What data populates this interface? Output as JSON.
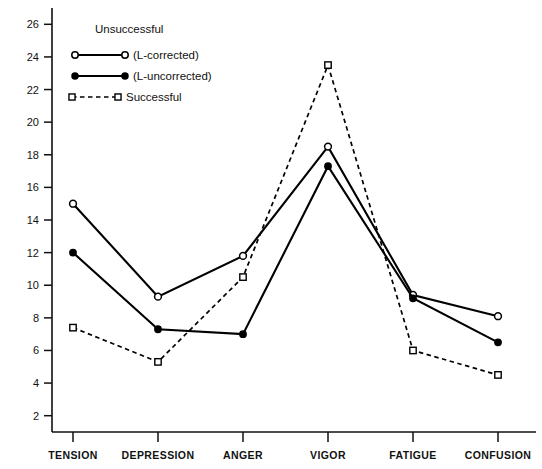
{
  "chart_data": {
    "type": "line",
    "title": "",
    "xlabel": "",
    "ylabel": "",
    "categories": [
      "TENSION",
      "DEPRESSION",
      "ANGER",
      "VIGOR",
      "FATIGUE",
      "CONFUSION"
    ],
    "ylim": [
      1,
      27
    ],
    "yticks": [
      2,
      4,
      6,
      8,
      10,
      12,
      14,
      16,
      18,
      20,
      22,
      24,
      26
    ],
    "grid": false,
    "legend_position": "top-left",
    "series": [
      {
        "name": "Unsuccessful (L-corrected)",
        "marker": "open-circle",
        "line": "solid",
        "values": [
          15.0,
          9.3,
          11.8,
          18.5,
          9.4,
          8.1
        ]
      },
      {
        "name": "Unsuccessful (L-uncorrected)",
        "marker": "filled-circle",
        "line": "solid",
        "values": [
          12.0,
          7.3,
          7.0,
          17.3,
          9.2,
          6.5
        ]
      },
      {
        "name": "Successful",
        "marker": "open-square",
        "line": "dashed",
        "values": [
          7.4,
          5.3,
          10.5,
          23.5,
          6.0,
          4.5
        ]
      }
    ]
  },
  "legend": {
    "group_heading": "Unsuccessful",
    "entries": [
      {
        "label": "(L-corrected)",
        "marker": "open-circle",
        "line": "solid"
      },
      {
        "label": "(L-uncorrected)",
        "marker": "filled-circle",
        "line": "solid"
      },
      {
        "label": "Successful",
        "marker": "open-square",
        "line": "dashed"
      }
    ]
  },
  "colors": {
    "ink": "#111111",
    "line": "#000000",
    "background": "#ffffff"
  }
}
